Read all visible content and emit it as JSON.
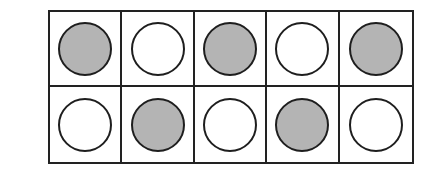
{
  "diagram": {
    "type": "ten-frame",
    "rows": 2,
    "columns": 5,
    "colors": {
      "filled": "#b4b4b4",
      "empty": "#ffffff",
      "stroke": "#1e1e1e"
    },
    "cells": [
      [
        {
          "state": "filled"
        },
        {
          "state": "empty"
        },
        {
          "state": "filled"
        },
        {
          "state": "empty"
        },
        {
          "state": "filled"
        }
      ],
      [
        {
          "state": "empty"
        },
        {
          "state": "filled"
        },
        {
          "state": "empty"
        },
        {
          "state": "filled"
        },
        {
          "state": "empty"
        }
      ]
    ],
    "filled_count": 5,
    "empty_count": 5
  }
}
